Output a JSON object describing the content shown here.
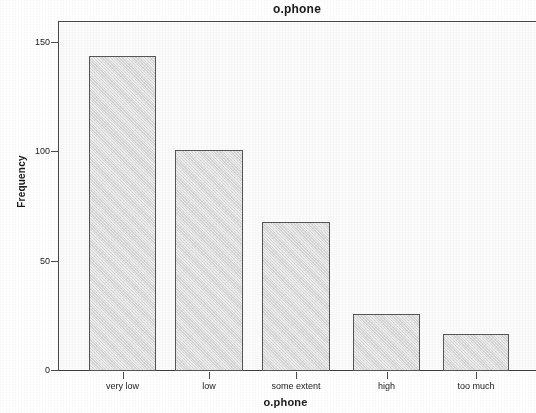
{
  "chart_data": {
    "type": "bar",
    "title": "o.phone",
    "xlabel": "o.phone",
    "ylabel": "Frequency",
    "categories": [
      "very low",
      "low",
      "some extent",
      "high",
      "too much"
    ],
    "values": [
      144,
      101,
      68,
      26,
      17
    ],
    "ylim": [
      0,
      160
    ],
    "yticks": [
      0,
      50,
      100,
      150
    ],
    "ytick_labels": [
      "0",
      "50",
      "100",
      "150"
    ],
    "grid": false,
    "legend": false,
    "bar_fill_color": "#d9d9d9",
    "bar_edge_color": "#55555a",
    "plot_background_color": "#fbfbfb",
    "axis_color": "#4a4a4a",
    "text_color": "#1b1b1b"
  }
}
